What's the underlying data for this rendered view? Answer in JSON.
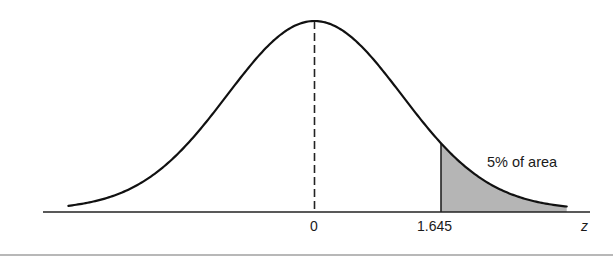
{
  "chart_data": {
    "type": "area",
    "title": "",
    "xlabel": "z",
    "ylabel": "",
    "x_ticks": [
      {
        "value": 0,
        "label": "0"
      },
      {
        "value": 1.645,
        "label": "1.645"
      }
    ],
    "xlim": [
      -3.2,
      3.28
    ],
    "distribution": {
      "name": "normal",
      "mean": 0,
      "sd": 1
    },
    "mean_line": {
      "x": 0,
      "style": "dashed"
    },
    "shaded_region": {
      "from": 1.645,
      "to": 3.28,
      "area_fraction": 0.05,
      "label": "5% of area",
      "color": "#b5b5b5"
    },
    "grid": false,
    "legend": null
  },
  "annotations": {
    "tail_label": "5% of area",
    "axis_label": "z",
    "tick_zero": "0",
    "tick_critical": "1.645"
  },
  "colors": {
    "curve": "#111111",
    "axis": "#222222",
    "shade": "#b5b5b5",
    "background": "#ffffff"
  }
}
